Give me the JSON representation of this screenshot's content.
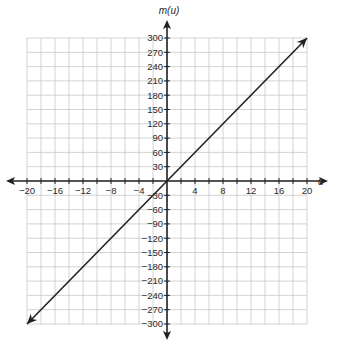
{
  "chart_data": {
    "type": "line",
    "title": "",
    "xlabel": "u",
    "ylabel": "m(u)",
    "xlim": [
      -20,
      20
    ],
    "ylim": [
      -300,
      300
    ],
    "grid": true,
    "legend": null,
    "x_ticks": [
      -20,
      -16,
      -12,
      -8,
      -4,
      4,
      8,
      12,
      16,
      20
    ],
    "x_tick_labels": [
      "−20",
      "−16",
      "−12",
      "−8",
      "−4",
      "4",
      "8",
      "12",
      "16",
      "20"
    ],
    "y_ticks": [
      300,
      270,
      240,
      210,
      180,
      150,
      120,
      90,
      60,
      30,
      -30,
      -60,
      -90,
      -120,
      -150,
      -180,
      -210,
      -240,
      -270,
      -300
    ],
    "y_tick_labels": [
      "300",
      "270",
      "240",
      "210",
      "180",
      "150",
      "120",
      "90",
      "60",
      "30",
      "−30",
      "−60",
      "−90",
      "−120",
      "−150",
      "−180",
      "−210",
      "−240",
      "−270",
      "−300"
    ],
    "series": [
      {
        "name": "m(u)",
        "x": [
          -20,
          0,
          20
        ],
        "y": [
          -300,
          0,
          300
        ],
        "slope": 15,
        "intercept": 0,
        "arrows_both_ends": true
      }
    ],
    "grid_minor_x_step": 2,
    "grid_minor_y_step": 30
  },
  "labels": {
    "x_axis": "u",
    "y_axis": "m(u)"
  }
}
